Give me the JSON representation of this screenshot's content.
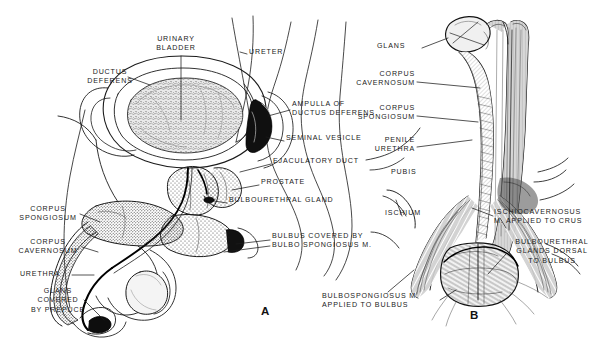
{
  "figure": {
    "background_color": "#ffffff",
    "ink_color": "#1b1b1b"
  },
  "panels": [
    {
      "id": "A",
      "letter": "A",
      "caption_letter": "A",
      "x": 261,
      "y": 311
    },
    {
      "id": "B",
      "letter": "B",
      "caption_letter": "B",
      "x": 470,
      "y": 315
    }
  ],
  "labels_panel_a": [
    {
      "name": "urinary-bladder",
      "lines": [
        "URINARY",
        "BLADDER"
      ],
      "x": 176,
      "y": 40,
      "align": "ctr"
    },
    {
      "name": "ureter",
      "lines": [
        "URETER"
      ],
      "x": 249,
      "y": 52,
      "align": "left"
    },
    {
      "name": "ductus-deferens",
      "lines": [
        "DUCTUS",
        "DEFERENS"
      ],
      "x": 110,
      "y": 73,
      "align": "ctr"
    },
    {
      "name": "ampulla-of-ductus-deferens",
      "lines": [
        "AMPULLA OF",
        "DUCTUS DEFERENS"
      ],
      "x": 292,
      "y": 104,
      "align": "left"
    },
    {
      "name": "seminal-vesicle",
      "lines": [
        "SEMINAL VESICLE"
      ],
      "x": 286,
      "y": 138,
      "align": "left"
    },
    {
      "name": "ejaculatory-duct",
      "lines": [
        "EJACULATORY DUCT"
      ],
      "x": 273,
      "y": 161,
      "align": "left"
    },
    {
      "name": "prostate",
      "lines": [
        "PROSTATE"
      ],
      "x": 261,
      "y": 182,
      "align": "left"
    },
    {
      "name": "bulbourethral-gland",
      "lines": [
        "BULBOURETHRAL GLAND"
      ],
      "x": 229,
      "y": 200,
      "align": "left"
    },
    {
      "name": "bulbus-covered-by-bulbo-spongiosus-m",
      "lines": [
        "BULBUS COVERED BY",
        "BULBO SPONGIOSUS  M."
      ],
      "x": 272,
      "y": 235,
      "align": "left"
    },
    {
      "name": "corpus-spongiosum-a",
      "lines": [
        "CORPUS",
        "SPONGIOSUM"
      ],
      "x": 48,
      "y": 210,
      "align": "ctr"
    },
    {
      "name": "corpus-cavernosum-a",
      "lines": [
        "CORPUS",
        "CAVERNOSUM"
      ],
      "x": 48,
      "y": 242,
      "align": "ctr"
    },
    {
      "name": "urethra-a",
      "lines": [
        "URETHRA"
      ],
      "x": 48,
      "y": 272,
      "align": "ctr"
    },
    {
      "name": "glans-covered-by-prepuce",
      "lines": [
        "GLANS",
        "COVERED",
        "BY PREPUCE"
      ],
      "x": 58,
      "y": 291,
      "align": "ctr"
    }
  ],
  "labels_panel_b": [
    {
      "name": "glans-b",
      "lines": [
        "GLANS"
      ],
      "x": 405,
      "y": 45,
      "align": "left"
    },
    {
      "name": "corpus-cavernosum-b",
      "lines": [
        "CORPUS",
        "CAVERNOSUM"
      ],
      "x": 415,
      "y": 75,
      "align": "rt"
    },
    {
      "name": "corpus-spongiosum-b",
      "lines": [
        "CORPUS",
        "SPONGIOSUM"
      ],
      "x": 415,
      "y": 108,
      "align": "rt"
    },
    {
      "name": "penile-urethra",
      "lines": [
        "PENILE",
        "URETHRA"
      ],
      "x": 415,
      "y": 140,
      "align": "rt"
    },
    {
      "name": "pubis",
      "lines": [
        "PUBIS"
      ],
      "x": 391,
      "y": 172,
      "align": "left"
    },
    {
      "name": "ischium",
      "lines": [
        "ISCHIUM"
      ],
      "x": 385,
      "y": 213,
      "align": "left"
    },
    {
      "name": "ischiocavernosus-m-applied-to-crus",
      "lines": [
        "ISCHIOCAVERNOSUS",
        "M. APPLIED TO CRUS"
      ],
      "x": 495,
      "y": 212,
      "align": "left"
    },
    {
      "name": "bulbourethral-glands-dorsal-to-bulbus",
      "lines": [
        "BULBOURETHRAL",
        "GLANDS DORSAL",
        "TO BULBUS"
      ],
      "x": 508,
      "y": 242,
      "align": "left"
    },
    {
      "name": "bulbospongiosus-m-applied-to-bulbus",
      "lines": [
        "BULBOSPONGIOSUS M.",
        "APPLIED TO BULBUS"
      ],
      "x": 322,
      "y": 296,
      "align": "left"
    }
  ]
}
